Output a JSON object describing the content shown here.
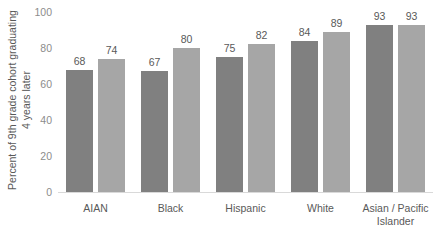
{
  "chart_data": {
    "type": "bar",
    "title": "",
    "subtitle": "",
    "xlabel": "",
    "ylabel": "Percent of 9th grade cohort graduating 4 years later",
    "ylabel_lines": [
      "Percent of 9th grade cohort graduating",
      "4 years later"
    ],
    "categories": [
      "AIAN",
      "Black",
      "Hispanic",
      "White",
      "Asian / Pacific Islander"
    ],
    "category_lines": [
      [
        "AIAN"
      ],
      [
        "Black"
      ],
      [
        "Hispanic"
      ],
      [
        "White"
      ],
      [
        "Asian / Pacific",
        "Islander"
      ]
    ],
    "series": [
      {
        "name": "series-1",
        "color": "#808080",
        "values": [
          68,
          67,
          75,
          84,
          93
        ]
      },
      {
        "name": "series-2",
        "color": "#a6a6a6",
        "values": [
          74,
          80,
          82,
          89,
          93
        ]
      }
    ],
    "ylim": [
      0,
      100
    ],
    "yticks": [
      100,
      80,
      60,
      40,
      20,
      0
    ],
    "ytick_labels": [
      "100",
      "80",
      "60",
      "40",
      "20",
      "0"
    ],
    "grid": false,
    "legend": "none",
    "data_labels": true,
    "axis_line_color": "#d9d9d9",
    "tick_label_color": "#8c8c8c",
    "text_color": "#595959",
    "background": "#ffffff"
  }
}
